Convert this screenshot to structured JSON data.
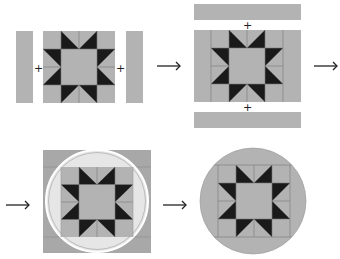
{
  "diagram": {
    "colors": {
      "fabric": "#b3b3b3",
      "star": "#1a1a1a",
      "seam": "#7a7a7a",
      "faded_fabric": "#e6e6e6",
      "faded_star": "#9a9a9a",
      "faded_border": "#a8a8a8",
      "arrow": "#222222"
    },
    "steps": [
      {
        "id": 1,
        "description": "Add side strips to star block",
        "join_symbols": [
          "+",
          "+"
        ]
      },
      {
        "id": 2,
        "description": "Add top and bottom strips",
        "join_symbols": [
          "+",
          "+"
        ]
      },
      {
        "id": 3,
        "description": "Mark circle on bordered block"
      },
      {
        "id": 4,
        "description": "Trim to circle"
      }
    ],
    "arrows": [
      "→",
      "→",
      "→",
      "→"
    ],
    "plus_sign": "+"
  }
}
